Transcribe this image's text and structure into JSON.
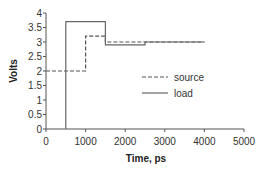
{
  "chart_data": {
    "type": "line",
    "title": "",
    "xlabel": "Time, ps",
    "ylabel": "Volts",
    "xlim": [
      0,
      5000
    ],
    "ylim": [
      0,
      4
    ],
    "x_ticks": [
      0,
      1000,
      2000,
      3000,
      4000,
      5000
    ],
    "y_ticks": [
      0,
      0.5,
      1,
      1.5,
      2,
      2.5,
      3,
      3.5,
      4
    ],
    "x_tick_labels": [
      "0",
      "1000",
      "2000",
      "3000",
      "4000",
      "5000"
    ],
    "y_tick_labels": [
      "0",
      "0.5",
      "1",
      "1.5",
      "2",
      "2.5",
      "3",
      "3.5",
      "4"
    ],
    "grid": false,
    "legend_position": "inside-right",
    "series": [
      {
        "name": "source",
        "style": "dashed",
        "color": "#555555",
        "points": [
          [
            0,
            2.0
          ],
          [
            1000,
            2.0
          ],
          [
            1000,
            3.2
          ],
          [
            1500,
            3.2
          ],
          [
            1500,
            3.0
          ],
          [
            4000,
            3.0
          ]
        ]
      },
      {
        "name": "load",
        "style": "solid",
        "color": "#666666",
        "points": [
          [
            500,
            0.0
          ],
          [
            500,
            3.7
          ],
          [
            1500,
            3.7
          ],
          [
            1500,
            2.9
          ],
          [
            2500,
            2.9
          ],
          [
            2500,
            3.0
          ],
          [
            4000,
            3.0
          ]
        ]
      }
    ]
  },
  "legend": {
    "items": [
      {
        "label": "source",
        "style": "dashed"
      },
      {
        "label": "load",
        "style": "solid"
      }
    ]
  }
}
